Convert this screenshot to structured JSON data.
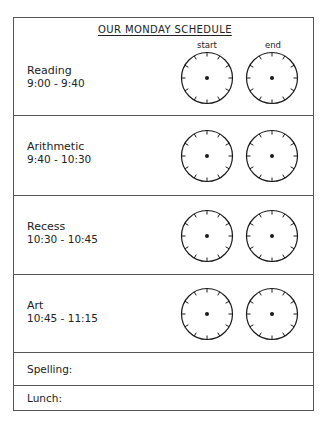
{
  "title": "OUR MONDAY SCHEDULE",
  "columns": {
    "start": "start",
    "end": "end"
  },
  "rows": [
    {
      "name": "Reading",
      "time": "9:00 - 9:40"
    },
    {
      "name": "Arithmetic",
      "time": "9:40 - 10:30"
    },
    {
      "name": "Recess",
      "time": "10:30 - 10:45"
    },
    {
      "name": "Art",
      "time": "10:45 - 11:15"
    }
  ],
  "extra_rows": [
    {
      "label": "Spelling:"
    },
    {
      "label": "Lunch:"
    }
  ],
  "clock": {
    "tick_count": 12,
    "face_color": "#ffffff",
    "stroke_color": "#1a1a1a"
  }
}
